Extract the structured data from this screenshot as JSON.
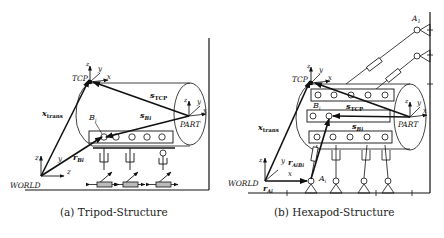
{
  "panels": [
    {
      "id": "a",
      "caption": "(a) Tripod-Structure",
      "labels": {
        "tcp": "TCP",
        "part": "PART",
        "world": "WORLD",
        "x_trans": "x",
        "x_trans_sub": "trans",
        "s_tcp": "s",
        "s_tcp_sub": "TCP",
        "s_bi": "s",
        "s_bi_sub": "Bi",
        "r_bi": "r",
        "r_bi_sub": "Bi",
        "b_i": "B",
        "b_i_sub": "i",
        "axis_x": "x",
        "axis_y": "y",
        "axis_z": "z"
      }
    },
    {
      "id": "b",
      "caption": "(b) Hexapod-Structure",
      "labels": {
        "tcp": "TCP",
        "part": "PART",
        "world": "WORLD",
        "x_trans": "x",
        "x_trans_sub": "trans",
        "s_tcp": "s",
        "s_tcp_sub": "TCP",
        "s_bi": "s",
        "s_bi_sub": "Bi",
        "r_ai": "r",
        "r_ai_sub": "Ai",
        "r_aibi": "r",
        "r_aibi_sub": "AiBi",
        "b_i": "B",
        "b_i_sub": "i",
        "a_i": "A",
        "a_i_sub": "i",
        "a_1": "A",
        "a_1_sub": "1",
        "axis_x": "x",
        "axis_y": "y",
        "axis_z": "z"
      }
    }
  ]
}
